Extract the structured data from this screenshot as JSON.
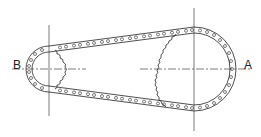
{
  "diagram": {
    "type": "chain-drive",
    "labels": {
      "driver": "A",
      "driven": "B"
    },
    "sprockets": [
      {
        "id": "B",
        "size": "small",
        "cx": 49,
        "cy": 69,
        "r": 23,
        "teeth_visible": "right half"
      },
      {
        "id": "A",
        "size": "large",
        "cx": 194,
        "cy": 69,
        "r": 41,
        "teeth_visible": "left half"
      }
    ],
    "colors": {
      "line": "#222222",
      "background": "#ffffff"
    }
  }
}
